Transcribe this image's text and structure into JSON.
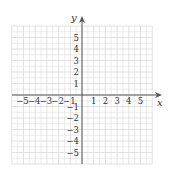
{
  "diagram": {
    "type": "coordinate-plane",
    "x_axis": {
      "label": "x",
      "min": -6,
      "max": 6,
      "tick_labels": [
        "-5",
        "-4",
        "-3",
        "-2",
        "-1",
        "1",
        "2",
        "3",
        "4",
        "5"
      ]
    },
    "y_axis": {
      "label": "y",
      "min": -6,
      "max": 6,
      "tick_labels": [
        "5",
        "4",
        "3",
        "2",
        "1",
        "-1",
        "-2",
        "-3",
        "-4",
        "-5"
      ]
    },
    "grid": {
      "visible": true,
      "minor_step": 0.5,
      "color": "#d9d9d9"
    },
    "axis_color": "#444444"
  }
}
